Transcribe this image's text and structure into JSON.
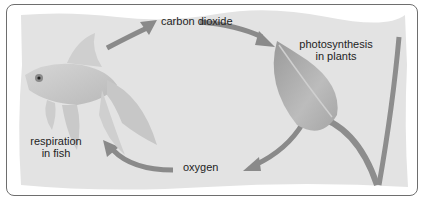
{
  "diagram": {
    "type": "cycle",
    "labels": {
      "carbon_dioxide": "carbon dioxide",
      "photosynthesis_line1": "photosynthesis",
      "photosynthesis_line2": "in plants",
      "oxygen": "oxygen",
      "respiration_line1": "respiration",
      "respiration_line2": "in fish"
    },
    "nodes": [
      {
        "id": "fish",
        "label": "respiration in fish"
      },
      {
        "id": "plant",
        "label": "photosynthesis in plants"
      }
    ],
    "edges": [
      {
        "from": "fish",
        "to": "carbon_dioxide"
      },
      {
        "from": "carbon_dioxide",
        "to": "plant"
      },
      {
        "from": "plant",
        "to": "oxygen"
      },
      {
        "from": "oxygen",
        "to": "fish"
      }
    ],
    "colors": {
      "background": "#e3e3e3",
      "arrow": "#8a8a8a",
      "border": "#6e6e6e",
      "text": "#1e1e1e"
    }
  }
}
